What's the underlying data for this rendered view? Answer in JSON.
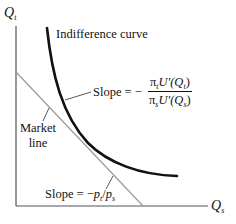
{
  "diagram": {
    "type": "indifference-curve-market-line",
    "axes": {
      "y_label": {
        "main": "Q",
        "sub": "t"
      },
      "x_label": {
        "main": "Q",
        "sub": "s"
      }
    },
    "curves": {
      "indifference_curve": {
        "label": "Indifference curve",
        "color": "#111111"
      },
      "market_line": {
        "label_line1": "Market",
        "label_line2": "line",
        "color": "#9a9a9a"
      }
    },
    "annotations": {
      "mrs_slope": {
        "prefix": "Slope = −",
        "numerator": {
          "pi": "π",
          "pi_sub": "t",
          "u": "U′(Q",
          "u_sub": "t",
          "close": ")"
        },
        "denominator": {
          "pi": "π",
          "pi_sub": "s",
          "u": "U′(Q",
          "u_sub": "s",
          "close": ")"
        }
      },
      "price_slope": {
        "prefix": "Slope = −",
        "p1": "p",
        "p1_sub": "t",
        "slash": "/",
        "p2": "p",
        "p2_sub": "s"
      }
    }
  }
}
